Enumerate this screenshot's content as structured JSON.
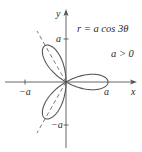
{
  "figure": {
    "equation": "r = a cos 3θ",
    "condition": "a > 0",
    "axes": {
      "x_label": "x",
      "y_label": "y",
      "x_ticks": [
        "−a",
        "a"
      ],
      "y_ticks": [
        "a",
        "−a"
      ]
    },
    "curve": {
      "type": "rose",
      "petals": 3,
      "petal_axes_degrees": [
        0,
        120,
        240
      ],
      "dashed_symmetry_lines": true
    },
    "colors": {
      "curve": "#555555",
      "axes": "#555555",
      "text": "#2a2a2a"
    }
  }
}
